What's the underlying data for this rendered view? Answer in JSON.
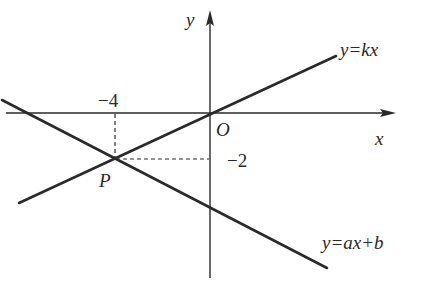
{
  "diagram": {
    "title": "",
    "axes": {
      "x_label": "x",
      "y_label": "y",
      "origin_label": "O"
    },
    "lines": [
      {
        "name": "y=kx",
        "label": "y=kx",
        "passes_through": [
          "O(0,0)",
          "P(-4,-2)"
        ]
      },
      {
        "name": "y=ax+b",
        "label": "y=ax+b",
        "passes_through": [
          "P(-4,-2)"
        ]
      }
    ],
    "point": {
      "label": "P",
      "x": -4,
      "y": -2
    },
    "tick_labels": {
      "x": "−4",
      "y": "−2"
    },
    "colors": {
      "line": "#2a2a2a",
      "background": "#ffffff"
    }
  }
}
